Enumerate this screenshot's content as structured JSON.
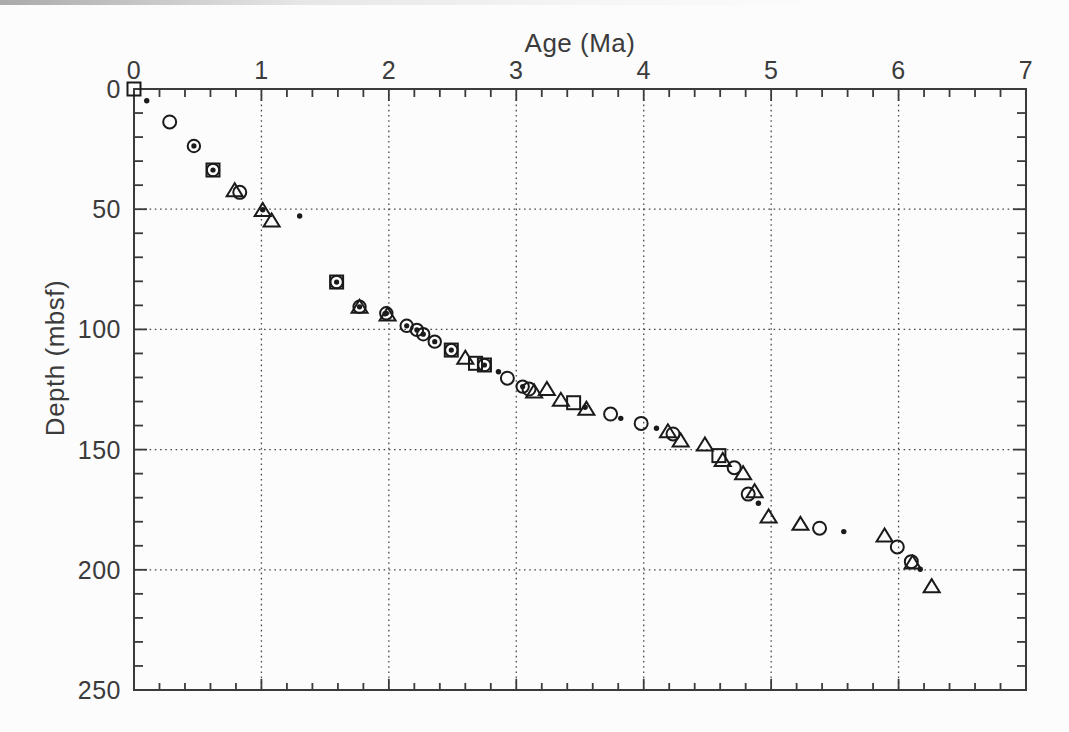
{
  "figure": {
    "background_color": "#fcfcfc",
    "ink_color": "#1a1a1a",
    "axis_color": "#3b3b3b",
    "grid_color": "#4a4a4a",
    "label_color": "#3b3b3b"
  },
  "chart_data": {
    "type": "scatter",
    "title": "",
    "xlabel": "Age (Ma)",
    "ylabel": "Depth (mbsf)",
    "xlim": [
      0,
      7
    ],
    "ylim": [
      0,
      250
    ],
    "x_axis_position": "top",
    "y_axis_inverted": true,
    "grid": "dotted lines at major ticks",
    "legend_position": "none",
    "x_major_ticks": [
      0,
      1,
      2,
      3,
      4,
      5,
      6,
      7
    ],
    "x_minor_tick_step": 0.2,
    "y_major_ticks": [
      0,
      50,
      100,
      150,
      200,
      250
    ],
    "y_minor_tick_step": 10,
    "series": [
      {
        "name": "open-square",
        "marker": "open-square",
        "points": [
          [
            0.0,
            0.0
          ],
          [
            0.62,
            33.7
          ],
          [
            1.59,
            80.3
          ],
          [
            2.49,
            108.6
          ],
          [
            2.68,
            114.1
          ],
          [
            2.75,
            114.8
          ],
          [
            3.45,
            130.5
          ],
          [
            4.59,
            152.5
          ]
        ]
      },
      {
        "name": "open-circle",
        "marker": "open-circle",
        "points": [
          [
            0.28,
            13.7
          ],
          [
            0.83,
            43.0
          ],
          [
            2.93,
            120.3
          ],
          [
            3.1,
            124.8
          ],
          [
            3.74,
            135.2
          ],
          [
            3.98,
            139.1
          ],
          [
            4.23,
            143.5
          ],
          [
            4.71,
            157.5
          ],
          [
            4.82,
            168.5
          ],
          [
            5.38,
            182.7
          ],
          [
            5.99,
            190.5
          ],
          [
            6.1,
            196.6
          ]
        ]
      },
      {
        "name": "circle-with-center-dot",
        "marker": "circle-dot",
        "points": [
          [
            0.47,
            23.7
          ],
          [
            0.62,
            33.7
          ],
          [
            1.59,
            80.3
          ],
          [
            1.77,
            90.6
          ],
          [
            1.98,
            93.3
          ],
          [
            2.14,
            98.5
          ],
          [
            2.22,
            100.2
          ],
          [
            2.27,
            102.0
          ],
          [
            2.36,
            105.1
          ],
          [
            2.49,
            108.6
          ],
          [
            2.75,
            114.8
          ],
          [
            3.05,
            123.8
          ]
        ]
      },
      {
        "name": "open-triangle",
        "marker": "open-triangle",
        "points": [
          [
            0.79,
            42.3
          ],
          [
            1.01,
            50.5
          ],
          [
            1.08,
            54.9
          ],
          [
            1.77,
            90.8
          ],
          [
            1.99,
            94.0
          ],
          [
            2.6,
            112.0
          ],
          [
            3.14,
            126.0
          ],
          [
            3.24,
            125.0
          ],
          [
            3.35,
            129.5
          ],
          [
            3.55,
            133.2
          ],
          [
            4.19,
            142.6
          ],
          [
            4.29,
            146.4
          ],
          [
            4.48,
            148.1
          ],
          [
            4.62,
            154.5
          ],
          [
            4.78,
            160.0
          ],
          [
            4.87,
            167.5
          ],
          [
            4.98,
            178.0
          ],
          [
            5.23,
            181.1
          ],
          [
            5.89,
            185.9
          ],
          [
            6.11,
            197.2
          ],
          [
            6.26,
            207.0
          ]
        ]
      },
      {
        "name": "small-filled-dot",
        "marker": "filled-dot",
        "points": [
          [
            0.1,
            4.9
          ],
          [
            1.01,
            50.2
          ],
          [
            1.3,
            52.8
          ],
          [
            1.97,
            93.5
          ],
          [
            2.86,
            117.6
          ],
          [
            3.54,
            132.4
          ],
          [
            3.82,
            137.0
          ],
          [
            4.1,
            141.1
          ],
          [
            4.9,
            172.3
          ],
          [
            5.57,
            184.1
          ],
          [
            6.17,
            199.8
          ]
        ]
      }
    ]
  }
}
